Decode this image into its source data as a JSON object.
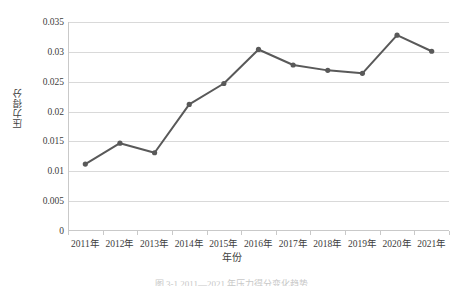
{
  "chart_data": {
    "type": "line",
    "title": "",
    "xlabel": "年份",
    "ylabel": "压力得分",
    "categories": [
      "2011年",
      "2012年",
      "2013年",
      "2014年",
      "2015年",
      "2016年",
      "2017年",
      "2018年",
      "2019年",
      "2020年",
      "2021年"
    ],
    "values": [
      0.0112,
      0.0147,
      0.0131,
      0.0212,
      0.0247,
      0.0304,
      0.0278,
      0.0269,
      0.0264,
      0.0328,
      0.0301
    ],
    "series": [
      {
        "name": "压力得分",
        "values": [
          0.0112,
          0.0147,
          0.0131,
          0.0212,
          0.0247,
          0.0304,
          0.0278,
          0.0269,
          0.0264,
          0.0328,
          0.0301
        ]
      }
    ],
    "ylim": [
      0,
      0.035
    ],
    "yticks": [
      0,
      0.005,
      0.01,
      0.015,
      0.02,
      0.025,
      0.03,
      0.035
    ],
    "ytick_labels": [
      "0",
      "0.005",
      "0.01",
      "0.015",
      "0.02",
      "0.025",
      "0.03",
      "0.035"
    ],
    "grid": "horizontal",
    "legend": "none",
    "line_color": "#595959",
    "marker_color": "#595959",
    "gridline_color": "#d9d9d9",
    "axis_color": "#c9c9c9",
    "marker": "circle",
    "annotations": []
  },
  "caption": {
    "text": "图 3-1 2011—2021 年压力得分变化趋势"
  }
}
